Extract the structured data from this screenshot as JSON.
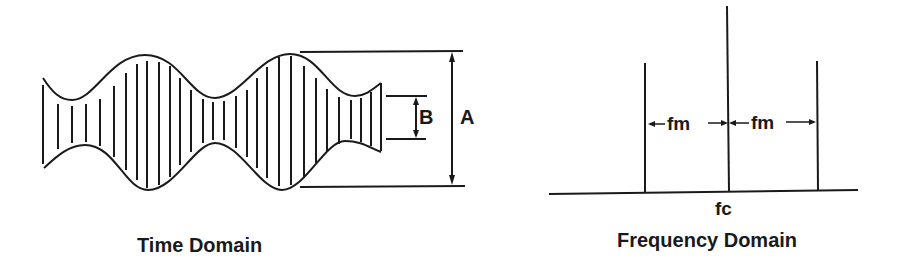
{
  "time_domain": {
    "caption": "Time Domain",
    "label_a": "A",
    "label_b": "B"
  },
  "frequency_domain": {
    "caption": "Frequency Domain",
    "carrier_label": "fc",
    "sideband_left_label": "fm",
    "sideband_right_label": "fm"
  },
  "colors": {
    "ink": "#1a1a1a",
    "background": "#ffffff"
  }
}
